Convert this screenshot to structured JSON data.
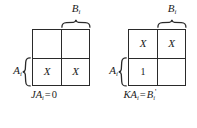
{
  "figure": {
    "background_color": "#ffffff",
    "line_color": "#2a2a2a",
    "text_color": "#1a1a1a"
  },
  "maps": [
    {
      "id": "j-map",
      "top_variable": "B",
      "top_variable_sub": "i",
      "side_variable": "A",
      "side_variable_sub": "i",
      "cells": [
        {
          "pos": "top-left",
          "value": ""
        },
        {
          "pos": "top-right",
          "value": ""
        },
        {
          "pos": "bottom-left",
          "value": "X"
        },
        {
          "pos": "bottom-right",
          "value": "X"
        }
      ],
      "caption": {
        "lhs": "JA",
        "lhs_sub": "i",
        "operator": "=",
        "rhs": "0",
        "rhs_prime": "",
        "full": "JA_i = 0"
      }
    },
    {
      "id": "k-map",
      "top_variable": "B",
      "top_variable_sub": "i",
      "side_variable": "A",
      "side_variable_sub": "i",
      "cells": [
        {
          "pos": "top-left",
          "value": "X"
        },
        {
          "pos": "top-right",
          "value": "X"
        },
        {
          "pos": "bottom-left",
          "value": "1"
        },
        {
          "pos": "bottom-right",
          "value": ""
        }
      ],
      "caption": {
        "lhs": "KA",
        "lhs_sub": "i",
        "operator": "=",
        "rhs": "B",
        "rhs_sub": "i",
        "rhs_prime": "'",
        "full": "KA_i = B_i'"
      }
    }
  ]
}
